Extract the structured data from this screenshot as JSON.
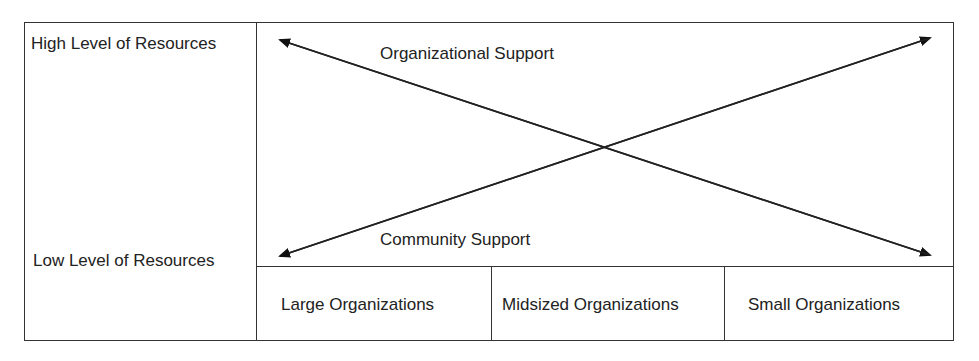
{
  "diagram": {
    "y_axis": {
      "high_label": "High Level of Resources",
      "low_label": "Low Level of Resources"
    },
    "arrows": [
      {
        "label": "Organizational Support",
        "from": "High Level of Resources (Large Organizations)",
        "to": "Low Level of Resources (Small Organizations)"
      },
      {
        "label": "Community Support",
        "from": "Low Level of Resources (Large Organizations)",
        "to": "High Level of Resources (Small Organizations)"
      }
    ],
    "x_axis": {
      "categories": [
        "Large Organizations",
        "Midsized Organizations",
        "Small Organizations"
      ]
    }
  }
}
